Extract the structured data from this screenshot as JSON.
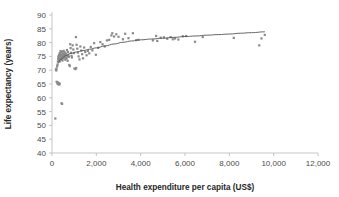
{
  "chart_data": {
    "type": "scatter",
    "title": "",
    "xlabel": "Health expenditure per capita (US$)",
    "ylabel": "Life expectancy (years)",
    "xlim": [
      0,
      12000
    ],
    "ylim": [
      40,
      90
    ],
    "xticks": [
      0,
      2000,
      4000,
      6000,
      8000,
      10000,
      12000
    ],
    "xtick_labels": [
      "0",
      "2,000",
      "4,000",
      "6,000",
      "8,000",
      "10,000",
      "12,000"
    ],
    "yticks": [
      40,
      45,
      50,
      55,
      60,
      65,
      70,
      75,
      80,
      85,
      90
    ],
    "ytick_labels": [
      "40",
      "45",
      "50",
      "55",
      "60",
      "65",
      "70",
      "75",
      "80",
      "85",
      "90"
    ],
    "grid": false,
    "legend": false,
    "point_color": "#8a8a8a",
    "trend_color": "#555555",
    "axis_color": "#b8b8b8",
    "series": [
      {
        "name": "Countries",
        "marker": "square",
        "points": [
          [
            150,
            52.5
          ],
          [
            210,
            65.8
          ],
          [
            240,
            65.2
          ],
          [
            260,
            65.6
          ],
          [
            290,
            65.0
          ],
          [
            300,
            64.8
          ],
          [
            330,
            65.3
          ],
          [
            345,
            64.9
          ],
          [
            430,
            58.0
          ],
          [
            455,
            57.8
          ],
          [
            175,
            70.2
          ],
          [
            195,
            69.9
          ],
          [
            205,
            70.6
          ],
          [
            230,
            71.4
          ],
          [
            250,
            72.0
          ],
          [
            265,
            73.1
          ],
          [
            275,
            74.2
          ],
          [
            285,
            75.0
          ],
          [
            300,
            73.6
          ],
          [
            310,
            74.8
          ],
          [
            320,
            75.5
          ],
          [
            335,
            74.1
          ],
          [
            345,
            76.2
          ],
          [
            355,
            73.2
          ],
          [
            365,
            75.8
          ],
          [
            375,
            74.6
          ],
          [
            385,
            76.9
          ],
          [
            395,
            73.9
          ],
          [
            405,
            75.2
          ],
          [
            415,
            74.4
          ],
          [
            425,
            76.4
          ],
          [
            435,
            75.6
          ],
          [
            445,
            74.0
          ],
          [
            455,
            76.8
          ],
          [
            465,
            75.1
          ],
          [
            475,
            73.5
          ],
          [
            485,
            74.9
          ],
          [
            495,
            76.1
          ],
          [
            505,
            75.4
          ],
          [
            515,
            74.3
          ],
          [
            525,
            77.0
          ],
          [
            540,
            75.9
          ],
          [
            555,
            74.7
          ],
          [
            570,
            76.5
          ],
          [
            585,
            75.3
          ],
          [
            600,
            73.8
          ],
          [
            615,
            74.5
          ],
          [
            630,
            76.0
          ],
          [
            645,
            75.7
          ],
          [
            660,
            74.2
          ],
          [
            675,
            77.3
          ],
          [
            690,
            75.0
          ],
          [
            705,
            73.4
          ],
          [
            720,
            76.6
          ],
          [
            740,
            75.5
          ],
          [
            760,
            74.8
          ],
          [
            780,
            71.9
          ],
          [
            800,
            71.5
          ],
          [
            820,
            79.4
          ],
          [
            840,
            78.0
          ],
          [
            860,
            76.3
          ],
          [
            880,
            75.2
          ],
          [
            900,
            74.6
          ],
          [
            930,
            79.0
          ],
          [
            960,
            77.5
          ],
          [
            990,
            76.2
          ],
          [
            1010,
            70.6
          ],
          [
            1060,
            70.4
          ],
          [
            1090,
            70.8
          ],
          [
            1080,
            82.0
          ],
          [
            1110,
            79.2
          ],
          [
            1140,
            77.8
          ],
          [
            1170,
            76.4
          ],
          [
            1200,
            75.0
          ],
          [
            1240,
            73.9
          ],
          [
            1280,
            78.6
          ],
          [
            1320,
            77.1
          ],
          [
            1360,
            75.8
          ],
          [
            1400,
            74.3
          ],
          [
            1450,
            78.2
          ],
          [
            1500,
            76.6
          ],
          [
            1560,
            75.4
          ],
          [
            1620,
            77.0
          ],
          [
            1680,
            76.1
          ],
          [
            1750,
            78.4
          ],
          [
            1820,
            77.2
          ],
          [
            1900,
            79.8
          ],
          [
            1980,
            75.6
          ],
          [
            2080,
            78.1
          ],
          [
            2180,
            80.2
          ],
          [
            2280,
            79.4
          ],
          [
            2380,
            78.6
          ],
          [
            2480,
            80.8
          ],
          [
            2580,
            81.0
          ],
          [
            2680,
            82.6
          ],
          [
            2720,
            83.4
          ],
          [
            2800,
            82.2
          ],
          [
            2900,
            83.0
          ],
          [
            3000,
            82.1
          ],
          [
            3200,
            81.2
          ],
          [
            3300,
            83.2
          ],
          [
            3450,
            81.6
          ],
          [
            3650,
            83.4
          ],
          [
            3800,
            80.9
          ],
          [
            3900,
            81.0
          ],
          [
            4550,
            80.8
          ],
          [
            4700,
            82.4
          ],
          [
            4750,
            80.6
          ],
          [
            4900,
            81.8
          ],
          [
            5050,
            81.9
          ],
          [
            5200,
            81.4
          ],
          [
            5350,
            82.0
          ],
          [
            5450,
            81.2
          ],
          [
            5550,
            81.5
          ],
          [
            5700,
            81.1
          ],
          [
            5900,
            82.3
          ],
          [
            6050,
            82.4
          ],
          [
            6450,
            80.3
          ],
          [
            6800,
            82.0
          ],
          [
            8200,
            81.7
          ],
          [
            9350,
            79.0
          ],
          [
            9450,
            81.5
          ],
          [
            9600,
            82.8
          ]
        ]
      }
    ],
    "trendline": {
      "name": "Logarithmic fit",
      "points": [
        [
          250,
          72.3
        ],
        [
          400,
          74.0
        ],
        [
          600,
          75.2
        ],
        [
          850,
          76.1
        ],
        [
          1100,
          76.6
        ],
        [
          1400,
          77.1
        ],
        [
          1700,
          77.6
        ],
        [
          2000,
          78.1
        ],
        [
          2400,
          78.8
        ],
        [
          2800,
          79.5
        ],
        [
          3200,
          80.1
        ],
        [
          3600,
          80.6
        ],
        [
          4000,
          81.0
        ],
        [
          4500,
          81.3
        ],
        [
          5000,
          81.6
        ],
        [
          5500,
          81.9
        ],
        [
          6000,
          82.2
        ],
        [
          6500,
          82.4
        ],
        [
          7000,
          82.7
        ],
        [
          7500,
          82.9
        ],
        [
          8000,
          83.1
        ],
        [
          8500,
          83.4
        ],
        [
          9000,
          83.6
        ],
        [
          9600,
          83.9
        ]
      ]
    }
  }
}
